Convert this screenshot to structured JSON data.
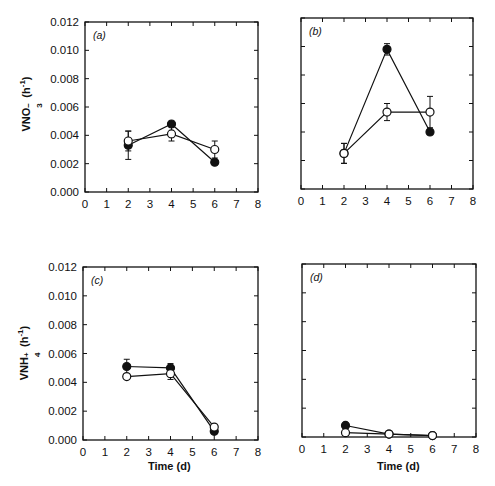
{
  "chart_data": [
    {
      "type": "line",
      "panel": "a",
      "panel_label": "(a)",
      "title": "",
      "xlabel": "",
      "ylabel": "VNO3- (h-1)",
      "xlim": [
        0,
        8
      ],
      "ylim": [
        0,
        0.012
      ],
      "xticks": [
        "0",
        "1",
        "2",
        "3",
        "4",
        "5",
        "6",
        "7",
        "8"
      ],
      "yticks": [
        "0.000",
        "0.002",
        "0.004",
        "0.006",
        "0.008",
        "0.010",
        "0.012"
      ],
      "x": [
        2,
        4,
        6
      ],
      "series": [
        {
          "name": "filled",
          "marker": "filled-circle",
          "values": [
            0.0033,
            0.0048,
            0.0021
          ],
          "err": [
            0.001,
            0.0,
            0.0
          ]
        },
        {
          "name": "open",
          "marker": "open-circle",
          "values": [
            0.0036,
            0.0041,
            0.003
          ],
          "err": [
            0.0007,
            0.0005,
            0.0006
          ]
        }
      ],
      "box": {
        "left": 85,
        "top": 22,
        "right": 258,
        "bottom": 192
      }
    },
    {
      "type": "line",
      "panel": "b",
      "panel_label": "(b)",
      "title": "",
      "xlabel": "",
      "ylabel": "",
      "xlim": [
        0,
        8
      ],
      "ylim": [
        0,
        0.012
      ],
      "xticks": [
        "0",
        "1",
        "2",
        "3",
        "4",
        "5",
        "6",
        "7",
        "8"
      ],
      "yticks": [],
      "x": [
        2,
        4,
        6
      ],
      "series": [
        {
          "name": "filled",
          "marker": "filled-circle",
          "values": [
            0.0025,
            0.0098,
            0.004
          ],
          "err": [
            0.0007,
            0.0004,
            0.0
          ]
        },
        {
          "name": "open",
          "marker": "open-circle",
          "values": [
            0.0025,
            0.0054,
            0.0054
          ],
          "err": [
            0.0007,
            0.0006,
            0.0011
          ]
        }
      ],
      "box": {
        "left": 301,
        "top": 18,
        "right": 473,
        "bottom": 189
      }
    },
    {
      "type": "line",
      "panel": "c",
      "panel_label": "(c)",
      "title": "",
      "xlabel": "Time (d)",
      "ylabel": "VNH4+ (h-1)",
      "xlim": [
        0,
        8
      ],
      "ylim": [
        0,
        0.012
      ],
      "xticks": [
        "0",
        "1",
        "2",
        "3",
        "4",
        "5",
        "6",
        "7",
        "8"
      ],
      "yticks": [
        "0.000",
        "0.002",
        "0.004",
        "0.006",
        "0.008",
        "0.010",
        "0.012"
      ],
      "x": [
        2,
        4,
        6
      ],
      "series": [
        {
          "name": "filled",
          "marker": "filled-circle",
          "values": [
            0.0051,
            0.005,
            0.0006
          ],
          "err": [
            0.0005,
            0.0003,
            0.0
          ]
        },
        {
          "name": "open",
          "marker": "open-circle",
          "values": [
            0.0044,
            0.0046,
            0.0009
          ],
          "err": [
            0.0,
            0.0004,
            0.0
          ]
        }
      ],
      "box": {
        "left": 83,
        "top": 267,
        "right": 258,
        "bottom": 440
      }
    },
    {
      "type": "line",
      "panel": "d",
      "panel_label": "(d)",
      "title": "",
      "xlabel": "Time (d)",
      "ylabel": "",
      "xlim": [
        0,
        8
      ],
      "ylim": [
        0,
        0.012
      ],
      "xticks": [
        "0",
        "1",
        "2",
        "3",
        "4",
        "5",
        "6",
        "7",
        "8"
      ],
      "yticks": [],
      "x": [
        2,
        4,
        6
      ],
      "series": [
        {
          "name": "filled",
          "marker": "filled-circle",
          "values": [
            0.0008,
            0.0002,
            0.0001
          ],
          "err": [
            0,
            0,
            0
          ]
        },
        {
          "name": "open",
          "marker": "open-circle",
          "values": [
            0.0003,
            0.0002,
            0.0001
          ],
          "err": [
            0,
            0,
            0
          ]
        }
      ],
      "box": {
        "left": 302,
        "top": 264,
        "right": 476,
        "bottom": 437
      }
    }
  ],
  "labels": {
    "a": "(a)",
    "b": "(b)",
    "c": "(c)",
    "d": "(d)",
    "ylabel_top_main": "VNO",
    "ylabel_top_sub": "3",
    "ylabel_top_sup": "−",
    "ylabel_top_unit": "(h",
    "ylabel_top_unit_sup": "-1",
    "ylabel_top_close": ")",
    "ylabel_bottom_main": "VNH",
    "ylabel_bottom_sub": "4",
    "ylabel_bottom_sup": "+",
    "ylabel_bottom_unit": "(h",
    "ylabel_bottom_unit_sup": "-1",
    "ylabel_bottom_close": ")",
    "xlabel_time": "Time (d)"
  }
}
